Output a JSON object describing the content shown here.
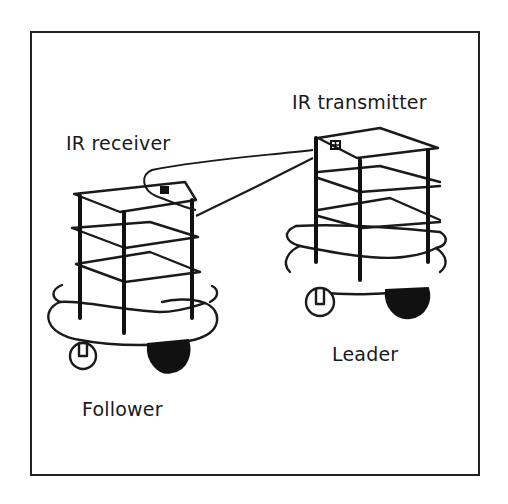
{
  "diagram": {
    "labels": {
      "ir_receiver": "IR receiver",
      "ir_transmitter": "IR transmitter",
      "follower": "Follower",
      "leader": "Leader"
    },
    "robots": [
      {
        "role": "Follower",
        "sensor": "IR receiver",
        "tiers": 3
      },
      {
        "role": "Leader",
        "sensor": "IR transmitter",
        "tiers": 3
      }
    ],
    "colors": {
      "line": "#1a1a1a",
      "background": "#ffffff"
    }
  }
}
